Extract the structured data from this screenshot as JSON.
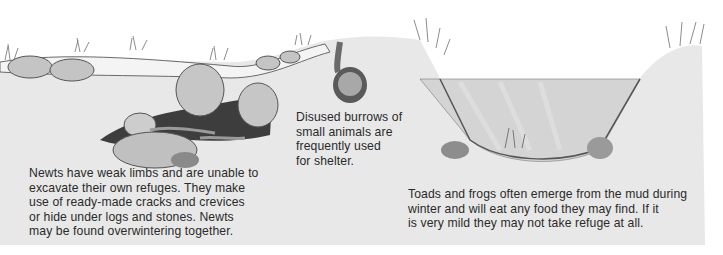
{
  "illustration": {
    "subject": "Cross-section of ground and pond showing amphibian winter refuges",
    "elements": [
      "stones",
      "grass-tufts",
      "newts-in-crevices",
      "toad-in-burrow",
      "pond",
      "frog-left-bank",
      "frog-right-bank"
    ],
    "colors": {
      "soil": "#e6e6e6",
      "soil_shadow": "#cfcfcf",
      "stone": "#bdbdbd",
      "outline": "#4a4a4a",
      "water": "#d6d6d6",
      "background": "#ffffff",
      "text": "#2a2a2a"
    }
  },
  "captions": {
    "newts": "Newts have weak limbs and are unable to\nexcavate their own refuges. They make\nuse of ready-made cracks and crevices\nor hide under logs and stones. Newts\nmay be found overwintering together.",
    "burrows": "Disused burrows of\nsmall animals are\nfrequently used\nfor shelter.",
    "toads": "Toads and frogs often emerge from the mud during\nwinter and will eat any food they may find. If it\nis very mild they may not take refuge at all."
  }
}
